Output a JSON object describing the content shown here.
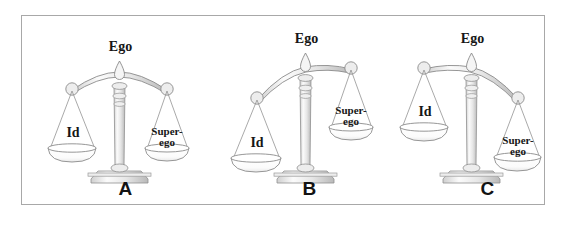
{
  "figure": {
    "background_color": "#ffffff",
    "border_color": "#a8a8a8",
    "metal_fill": "#f2f2f2",
    "metal_stroke": "#8c8c8c",
    "pan_fill": "#fdfdfd",
    "text_color": "#161616"
  },
  "scales": [
    {
      "id": "a",
      "caption": "A",
      "state": "balanced",
      "tilt_degrees": 0,
      "labels": {
        "top": "Ego",
        "left_pan": "Id",
        "right_pan_line1": "Super-",
        "right_pan_line2": "ego"
      }
    },
    {
      "id": "b",
      "caption": "B",
      "state": "tilted-left",
      "tilt_degrees": -13,
      "labels": {
        "top": "Ego",
        "left_pan": "Id",
        "right_pan_line1": "Super-",
        "right_pan_line2": "ego"
      }
    },
    {
      "id": "c",
      "caption": "C",
      "state": "tilted-right",
      "tilt_degrees": 13,
      "labels": {
        "top": "Ego",
        "left_pan": "Id",
        "right_pan_line1": "Super-",
        "right_pan_line2": "ego"
      }
    }
  ]
}
